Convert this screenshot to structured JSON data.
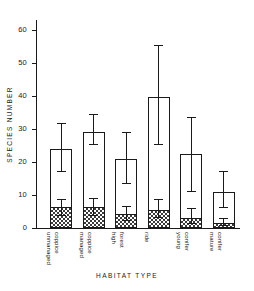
{
  "chart_data": {
    "type": "bar",
    "title": "",
    "xlabel": "HABITAT  TYPE",
    "ylabel": "SPECIES   NUMBER",
    "ylim": [
      0,
      63
    ],
    "yticks": [
      0,
      10,
      20,
      30,
      40,
      50,
      60
    ],
    "ytick_labels": [
      "0",
      "10",
      "20",
      "30",
      "40",
      "50",
      "60"
    ],
    "grid": false,
    "legend": "none",
    "categories": [
      "unmanaged coppice",
      "managed coppice",
      "high forest",
      "ride",
      "young conifer",
      "mature conifer"
    ],
    "category_lines": [
      [
        "unmanaged",
        "coppice"
      ],
      [
        "managed",
        "coppice"
      ],
      [
        "high",
        "forest"
      ],
      [
        "ride",
        ""
      ],
      [
        "young",
        "conifer"
      ],
      [
        "mature",
        "conifer"
      ]
    ],
    "series": [
      {
        "name": "total species number",
        "style": "open bar",
        "values": [
          24.0,
          29.2,
          21.0,
          39.8,
          22.5,
          10.9
        ]
      },
      {
        "name": "subset (hatched portion)",
        "style": "checkerboard hatched bar",
        "values": [
          6.3,
          6.3,
          4.1,
          5.6,
          2.9,
          1.5
        ]
      }
    ],
    "error_bars": [
      {
        "category": "unmanaged coppice",
        "on": "total",
        "low": 17.0,
        "high": 31.5
      },
      {
        "category": "unmanaged coppice",
        "on": "hatched",
        "low": 3.5,
        "high": 8.6
      },
      {
        "category": "managed coppice",
        "on": "total",
        "low": 25.0,
        "high": 34.1
      },
      {
        "category": "managed coppice",
        "on": "hatched",
        "low": 3.7,
        "high": 8.8
      },
      {
        "category": "high forest",
        "on": "total",
        "low": 13.2,
        "high": 28.9
      },
      {
        "category": "high forest",
        "on": "hatched",
        "low": 2.2,
        "high": 6.3
      },
      {
        "category": "ride",
        "on": "total",
        "low": 25.0,
        "high": 55.0
      },
      {
        "category": "ride",
        "on": "hatched",
        "low": 3.0,
        "high": 8.4
      },
      {
        "category": "young conifer",
        "on": "total",
        "low": 10.9,
        "high": 33.4
      },
      {
        "category": "young conifer",
        "on": "hatched",
        "low": 1.2,
        "high": 5.7
      },
      {
        "category": "mature conifer",
        "on": "total",
        "low": 6.1,
        "high": 17.1
      },
      {
        "category": "mature conifer",
        "on": "hatched",
        "low": 0.6,
        "high": 2.6
      }
    ]
  },
  "colors": {
    "ink": "#1a1a1a",
    "background": "#ffffff",
    "hatch": "#3a3a3a"
  }
}
